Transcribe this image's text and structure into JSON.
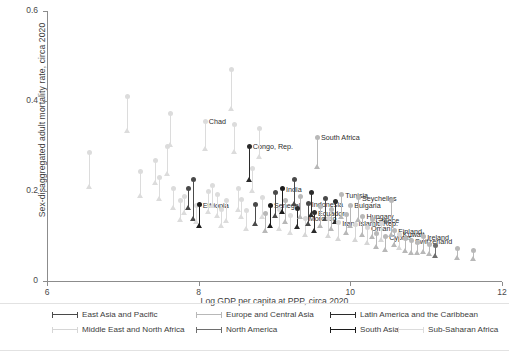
{
  "chart_data": {
    "type": "scatter",
    "title": "",
    "xlabel": "Log GDP per capita at PPP, circa 2020",
    "ylabel": "Sex-disaggregated adult mortality rate, circa 2020",
    "xlim": [
      6,
      12
    ],
    "ylim": [
      0,
      0.6
    ],
    "xticks": [
      "6",
      "8",
      "10",
      "12"
    ],
    "xtick_values": [
      6,
      8,
      10,
      12
    ],
    "yticks": [
      "0",
      "0.2",
      "0.4",
      "0.6"
    ],
    "ytick_values": [
      0,
      0.2,
      0.4,
      0.6
    ],
    "grid": false,
    "legend_position": "bottom",
    "marker_note": "each observation drawn as a vertical connector with a circle (upper value) and a triangle (lower value)",
    "regions": [
      {
        "name": "East Asia and Pacific",
        "color": "#4a4a4a"
      },
      {
        "name": "Europe and Central Asia",
        "color": "#b8b8b8"
      },
      {
        "name": "Latin America and the Caribbean",
        "color": "#2b2b2b"
      },
      {
        "name": "Middle East and North Africa",
        "color": "#d6d6d6"
      },
      {
        "name": "North America",
        "color": "#6e6e6e"
      },
      {
        "name": "South Asia",
        "color": "#1c1c1c"
      },
      {
        "name": "Sub-Saharan Africa",
        "color": "#dcdcdc"
      }
    ],
    "points": [
      {
        "x": 6.55,
        "hi": 0.285,
        "lo": 0.205,
        "region": 6,
        "label": ""
      },
      {
        "x": 7.05,
        "hi": 0.41,
        "lo": 0.33,
        "region": 6,
        "label": ""
      },
      {
        "x": 7.22,
        "hi": 0.243,
        "lo": 0.185,
        "region": 6,
        "label": ""
      },
      {
        "x": 7.42,
        "hi": 0.268,
        "lo": 0.214,
        "region": 6,
        "label": ""
      },
      {
        "x": 7.48,
        "hi": 0.23,
        "lo": 0.178,
        "region": 6,
        "label": ""
      },
      {
        "x": 7.58,
        "hi": 0.3,
        "lo": 0.235,
        "region": 6,
        "label": ""
      },
      {
        "x": 7.62,
        "hi": 0.372,
        "lo": 0.3,
        "region": 6,
        "label": ""
      },
      {
        "x": 7.66,
        "hi": 0.205,
        "lo": 0.158,
        "region": 6,
        "label": ""
      },
      {
        "x": 7.76,
        "hi": 0.178,
        "lo": 0.132,
        "region": 6,
        "label": ""
      },
      {
        "x": 7.8,
        "hi": 0.188,
        "lo": 0.148,
        "region": 6,
        "label": ""
      },
      {
        "x": 7.86,
        "hi": 0.205,
        "lo": 0.16,
        "region": 0,
        "label": ""
      },
      {
        "x": 7.92,
        "hi": 0.225,
        "lo": 0.135,
        "region": 0,
        "label": ""
      },
      {
        "x": 7.96,
        "hi": 0.168,
        "lo": 0.128,
        "region": 6,
        "label": ""
      },
      {
        "x": 8.0,
        "hi": 0.17,
        "lo": 0.12,
        "region": 5,
        "label": "Ethiopia"
      },
      {
        "x": 8.08,
        "hi": 0.355,
        "lo": 0.29,
        "region": 6,
        "label": "Chad"
      },
      {
        "x": 8.12,
        "hi": 0.2,
        "lo": 0.15,
        "region": 6,
        "label": ""
      },
      {
        "x": 8.18,
        "hi": 0.212,
        "lo": 0.163,
        "region": 6,
        "label": ""
      },
      {
        "x": 8.24,
        "hi": 0.192,
        "lo": 0.142,
        "region": 6,
        "label": ""
      },
      {
        "x": 8.3,
        "hi": 0.16,
        "lo": 0.118,
        "region": 6,
        "label": ""
      },
      {
        "x": 8.36,
        "hi": 0.178,
        "lo": 0.13,
        "region": 6,
        "label": ""
      },
      {
        "x": 8.42,
        "hi": 0.47,
        "lo": 0.38,
        "region": 6,
        "label": ""
      },
      {
        "x": 8.46,
        "hi": 0.348,
        "lo": 0.283,
        "region": 6,
        "label": ""
      },
      {
        "x": 8.52,
        "hi": 0.205,
        "lo": 0.155,
        "region": 6,
        "label": ""
      },
      {
        "x": 8.56,
        "hi": 0.182,
        "lo": 0.138,
        "region": 6,
        "label": ""
      },
      {
        "x": 8.62,
        "hi": 0.156,
        "lo": 0.112,
        "region": 6,
        "label": ""
      },
      {
        "x": 8.66,
        "hi": 0.3,
        "lo": 0.222,
        "region": 2,
        "label": "Congo, Rep."
      },
      {
        "x": 8.7,
        "hi": 0.25,
        "lo": 0.196,
        "region": 6,
        "label": ""
      },
      {
        "x": 8.74,
        "hi": 0.17,
        "lo": 0.124,
        "region": 0,
        "label": ""
      },
      {
        "x": 8.8,
        "hi": 0.34,
        "lo": 0.272,
        "region": 6,
        "label": ""
      },
      {
        "x": 8.84,
        "hi": 0.186,
        "lo": 0.14,
        "region": 6,
        "label": ""
      },
      {
        "x": 8.88,
        "hi": 0.15,
        "lo": 0.108,
        "region": 1,
        "label": ""
      },
      {
        "x": 8.94,
        "hi": 0.168,
        "lo": 0.12,
        "region": 5,
        "label": "Senegal"
      },
      {
        "x": 9.0,
        "hi": 0.196,
        "lo": 0.142,
        "region": 0,
        "label": ""
      },
      {
        "x": 9.06,
        "hi": 0.158,
        "lo": 0.112,
        "region": 6,
        "label": ""
      },
      {
        "x": 9.1,
        "hi": 0.205,
        "lo": 0.15,
        "region": 5,
        "label": "India"
      },
      {
        "x": 9.14,
        "hi": 0.178,
        "lo": 0.128,
        "region": 1,
        "label": ""
      },
      {
        "x": 9.2,
        "hi": 0.146,
        "lo": 0.104,
        "region": 6,
        "label": ""
      },
      {
        "x": 9.26,
        "hi": 0.225,
        "lo": 0.168,
        "region": 0,
        "label": ""
      },
      {
        "x": 9.3,
        "hi": 0.162,
        "lo": 0.116,
        "region": 2,
        "label": ""
      },
      {
        "x": 9.34,
        "hi": 0.188,
        "lo": 0.138,
        "region": 1,
        "label": ""
      },
      {
        "x": 9.4,
        "hi": 0.14,
        "lo": 0.098,
        "region": 3,
        "label": "Morocco"
      },
      {
        "x": 9.44,
        "hi": 0.172,
        "lo": 0.124,
        "region": 0,
        "label": "Indonesia"
      },
      {
        "x": 9.48,
        "hi": 0.196,
        "lo": 0.144,
        "region": 2,
        "label": ""
      },
      {
        "x": 9.52,
        "hi": 0.152,
        "lo": 0.108,
        "region": 2,
        "label": "Ecuador"
      },
      {
        "x": 9.56,
        "hi": 0.32,
        "lo": 0.25,
        "region": 1,
        "label": "South Africa"
      },
      {
        "x": 9.6,
        "hi": 0.166,
        "lo": 0.118,
        "region": 1,
        "label": ""
      },
      {
        "x": 9.66,
        "hi": 0.184,
        "lo": 0.134,
        "region": 0,
        "label": ""
      },
      {
        "x": 9.7,
        "hi": 0.138,
        "lo": 0.096,
        "region": 3,
        "label": ""
      },
      {
        "x": 9.74,
        "hi": 0.158,
        "lo": 0.112,
        "region": 1,
        "label": ""
      },
      {
        "x": 9.8,
        "hi": 0.176,
        "lo": 0.128,
        "region": 2,
        "label": ""
      },
      {
        "x": 9.84,
        "hi": 0.13,
        "lo": 0.09,
        "region": 3,
        "label": "Iran, Islamic Rep."
      },
      {
        "x": 9.88,
        "hi": 0.192,
        "lo": 0.14,
        "region": 1,
        "label": "Tunisia"
      },
      {
        "x": 9.94,
        "hi": 0.148,
        "lo": 0.104,
        "region": 1,
        "label": ""
      },
      {
        "x": 10.0,
        "hi": 0.168,
        "lo": 0.12,
        "region": 1,
        "label": "Bulgaria"
      },
      {
        "x": 10.06,
        "hi": 0.126,
        "lo": 0.088,
        "region": 3,
        "label": ""
      },
      {
        "x": 10.1,
        "hi": 0.185,
        "lo": 0.133,
        "region": 1,
        "label": "Seychelles"
      },
      {
        "x": 10.16,
        "hi": 0.144,
        "lo": 0.1,
        "region": 1,
        "label": "Hungary"
      },
      {
        "x": 10.22,
        "hi": 0.118,
        "lo": 0.082,
        "region": 3,
        "label": "Oman"
      },
      {
        "x": 10.28,
        "hi": 0.136,
        "lo": 0.094,
        "region": 1,
        "label": "Greece"
      },
      {
        "x": 10.34,
        "hi": 0.106,
        "lo": 0.072,
        "region": 1,
        "label": ""
      },
      {
        "x": 10.4,
        "hi": 0.128,
        "lo": 0.088,
        "region": 3,
        "label": ""
      },
      {
        "x": 10.46,
        "hi": 0.098,
        "lo": 0.066,
        "region": 1,
        "label": "Cyprus"
      },
      {
        "x": 10.54,
        "hi": 0.18,
        "lo": 0.1,
        "region": 1,
        "label": ""
      },
      {
        "x": 10.58,
        "hi": 0.112,
        "lo": 0.076,
        "region": 1,
        "label": "Finland"
      },
      {
        "x": 10.64,
        "hi": 0.104,
        "lo": 0.07,
        "region": 3,
        "label": "Kuwait"
      },
      {
        "x": 10.72,
        "hi": 0.094,
        "lo": 0.064,
        "region": 1,
        "label": ""
      },
      {
        "x": 10.8,
        "hi": 0.09,
        "lo": 0.06,
        "region": 1,
        "label": "Switzerland"
      },
      {
        "x": 10.88,
        "hi": 0.086,
        "lo": 0.058,
        "region": 1,
        "label": ""
      },
      {
        "x": 10.96,
        "hi": 0.098,
        "lo": 0.062,
        "region": 1,
        "label": "Ireland"
      },
      {
        "x": 11.04,
        "hi": 0.082,
        "lo": 0.056,
        "region": 1,
        "label": ""
      },
      {
        "x": 11.12,
        "hi": 0.078,
        "lo": 0.052,
        "region": 4,
        "label": ""
      },
      {
        "x": 11.4,
        "hi": 0.072,
        "lo": 0.048,
        "region": 1,
        "label": ""
      },
      {
        "x": 11.62,
        "hi": 0.068,
        "lo": 0.046,
        "region": 1,
        "label": ""
      }
    ]
  }
}
